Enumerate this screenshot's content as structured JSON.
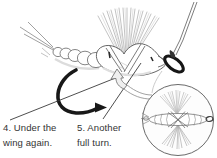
{
  "figure": {
    "kind": "fly-tying-instruction-diagram",
    "background": "#ffffff",
    "ink": "#1a1a1a",
    "line_gray": "#555555",
    "captions": {
      "step4": "4. Under the wing again.",
      "step5": "5. Another full turn."
    }
  }
}
